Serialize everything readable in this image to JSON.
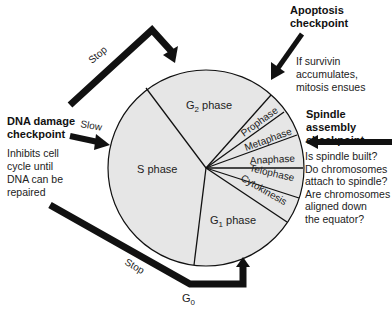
{
  "diagram": {
    "phases": [
      {
        "name": "G2 phase",
        "base": "G",
        "sub": "2",
        "suffix": " phase"
      },
      {
        "name": "S phase"
      },
      {
        "name": "G1 phase",
        "base": "G",
        "sub": "1",
        "suffix": " phase"
      },
      {
        "name": "Prophase"
      },
      {
        "name": "Metaphase"
      },
      {
        "name": "Anaphase"
      },
      {
        "name": "Telophase"
      },
      {
        "name": "Cytokinesis"
      }
    ],
    "g0": {
      "base": "G",
      "sub": "0"
    },
    "checkpoints": {
      "dna_damage": {
        "title_line1": "DNA damage",
        "title_line2": "checkpoint",
        "desc": [
          "Inhibits cell",
          "cycle until",
          "DNA can be",
          "repaired"
        ],
        "arrow_top_label": "Stop",
        "arrow_mid_label": "Slow",
        "arrow_bottom_label": "Stop"
      },
      "apoptosis": {
        "title_line1": "Apoptosis",
        "title_line2": "checkpoint",
        "desc": [
          "If survivin",
          "accumulates,",
          "mitosis ensues"
        ]
      },
      "spindle": {
        "title_line1": "Spindle assembly",
        "title_line2": "checkpoint",
        "desc": [
          "Is spindle built?",
          "Do chromosomes",
          "attach to spindle?",
          "Are chromosomes",
          "aligned down",
          "the equator?"
        ]
      }
    },
    "colors": {
      "fill": "#e6e6e6",
      "line": "#111111",
      "arrow": "#111111"
    }
  }
}
